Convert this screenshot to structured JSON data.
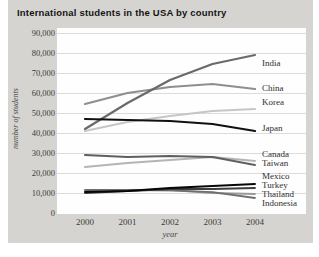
{
  "title": "International students in the USA by country",
  "chart_data": {
    "type": "line",
    "title": "International students in the USA by country",
    "xlabel": "year",
    "ylabel": "number of students",
    "x": [
      2000,
      2001,
      2002,
      2003,
      2004
    ],
    "xtick_labels": [
      "2000",
      "2001",
      "2002",
      "2003",
      "2004"
    ],
    "ylim": [
      0,
      90000
    ],
    "ytick_step": 10000,
    "yticks": [
      0,
      10000,
      20000,
      30000,
      40000,
      50000,
      60000,
      70000,
      80000,
      90000
    ],
    "ytick_labels": [
      "0",
      "10,000",
      "20,000",
      "30,000",
      "40,000",
      "50,000",
      "60,000",
      "70,000",
      "80,000",
      "90,000"
    ],
    "grid": true,
    "gridline_color": "#dcdcdc",
    "legend_position": "labels-at-right-edge",
    "series": [
      {
        "name": "India",
        "color": "#6a6a6a",
        "width": 2.2,
        "label_y": 35,
        "values": [
          42000,
          55000,
          66500,
          74500,
          79000
        ]
      },
      {
        "name": "China",
        "color": "#8e8e8e",
        "width": 2.2,
        "label_y": 60,
        "values": [
          54500,
          60000,
          63000,
          64500,
          62000
        ]
      },
      {
        "name": "Korea",
        "color": "#c6c6c6",
        "width": 2.2,
        "label_y": 74,
        "values": [
          41000,
          45500,
          48500,
          51000,
          52000
        ]
      },
      {
        "name": "Japan",
        "color": "#111111",
        "width": 2.2,
        "label_y": 100,
        "values": [
          47000,
          46500,
          46000,
          44500,
          41000
        ]
      },
      {
        "name": "Canada",
        "color": "#b4b4b4",
        "width": 2,
        "label_y": 126,
        "values": [
          23000,
          25000,
          26500,
          28000,
          26000
        ]
      },
      {
        "name": "Taiwan",
        "color": "#5f5f5f",
        "width": 2,
        "label_y": 135,
        "values": [
          29000,
          28000,
          28500,
          28000,
          24000
        ]
      },
      {
        "name": "Mexico",
        "color": "#070707",
        "width": 1.8,
        "label_y": 148,
        "values": [
          10500,
          11000,
          12500,
          13500,
          14500
        ]
      },
      {
        "name": "Turkey",
        "color": "#3d3d3d",
        "width": 1.8,
        "label_y": 157,
        "values": [
          10000,
          11000,
          12000,
          12000,
          12500
        ]
      },
      {
        "name": "Thailand",
        "color": "#9a9a9a",
        "width": 1.8,
        "label_y": 166,
        "values": [
          11000,
          11200,
          11500,
          10000,
          9500
        ]
      },
      {
        "name": "Indonesia",
        "color": "#6f6f6f",
        "width": 1.8,
        "label_y": 175,
        "values": [
          11500,
          11600,
          11300,
          10400,
          7500
        ]
      }
    ]
  },
  "colors": {
    "page_background": "#ffffff",
    "card_background": "#d6d4d1",
    "plot_background": "#fefefe",
    "title_text": "#141414",
    "tick_text": "#3c3c3c"
  }
}
